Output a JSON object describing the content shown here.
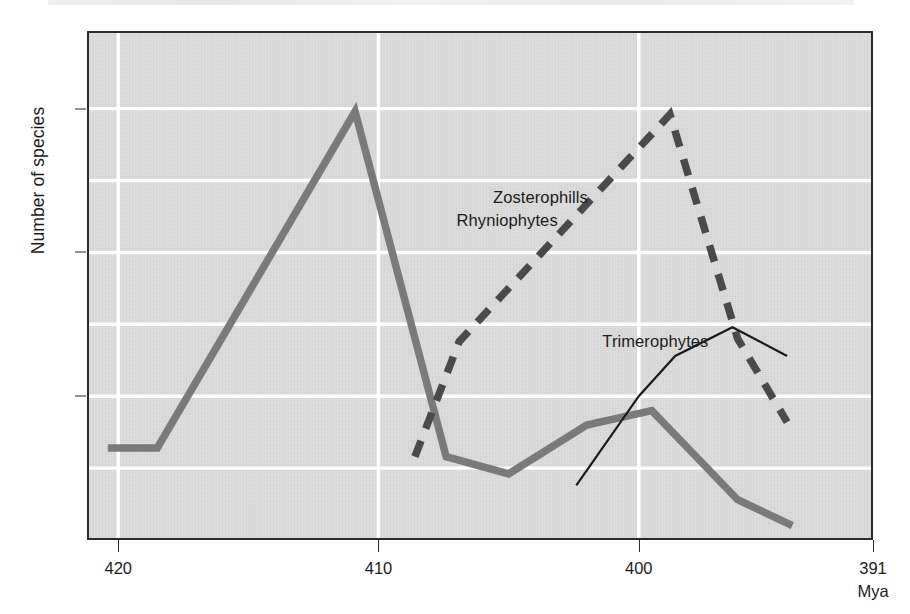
{
  "figure": {
    "ylabel": "Number of species",
    "xunit": "Mya"
  },
  "chart_data": {
    "type": "line",
    "title": "",
    "xlabel": "Mya",
    "ylabel": "Number of species",
    "xlim": [
      421.2,
      391.0
    ],
    "ylim": [
      0,
      17.7
    ],
    "x_axis_reversed": true,
    "xticks": [
      420,
      410,
      400,
      391
    ],
    "xticklabels": [
      "420",
      "410",
      "400",
      "391"
    ],
    "yticks": [
      5,
      10,
      15
    ],
    "yticklabels": [
      "5",
      "10",
      "15"
    ],
    "gridlines": {
      "horizontal_values": [
        2.5,
        5,
        7.5,
        10,
        12.5,
        15
      ],
      "vertical_values": [
        420,
        410,
        400
      ],
      "color": "#ffffff",
      "on": true
    },
    "legend_position": "inline-annotations",
    "plot_background": "#d8d8d8",
    "series": [
      {
        "name": "Rhyniophytes",
        "style": "solid-thick",
        "color": "#7a7a7a",
        "label_x": 407.0,
        "label_y": 11.1,
        "points": [
          {
            "x": 420.4,
            "y": 3.2
          },
          {
            "x": 418.5,
            "y": 3.2
          },
          {
            "x": 410.9,
            "y": 14.9
          },
          {
            "x": 407.4,
            "y": 2.9
          },
          {
            "x": 405.0,
            "y": 2.3
          },
          {
            "x": 402.0,
            "y": 4.0
          },
          {
            "x": 399.5,
            "y": 4.5
          },
          {
            "x": 396.2,
            "y": 1.4
          },
          {
            "x": 394.1,
            "y": 0.5
          }
        ]
      },
      {
        "name": "Zosterophills",
        "style": "dashed-thick",
        "color": "#4a4a4a",
        "label_x": 405.6,
        "label_y": 11.9,
        "points": [
          {
            "x": 408.6,
            "y": 2.9
          },
          {
            "x": 406.9,
            "y": 6.9
          },
          {
            "x": 398.8,
            "y": 14.8
          },
          {
            "x": 396.2,
            "y": 7.0
          },
          {
            "x": 394.3,
            "y": 4.1
          }
        ]
      },
      {
        "name": "Trimerophytes",
        "style": "solid-thin",
        "color": "#1b1b1b",
        "label_x": 401.4,
        "label_y": 6.9,
        "points": [
          {
            "x": 402.4,
            "y": 1.9
          },
          {
            "x": 400.0,
            "y": 5.0
          },
          {
            "x": 398.6,
            "y": 6.4
          },
          {
            "x": 396.4,
            "y": 7.4
          },
          {
            "x": 394.3,
            "y": 6.4
          }
        ]
      }
    ]
  }
}
